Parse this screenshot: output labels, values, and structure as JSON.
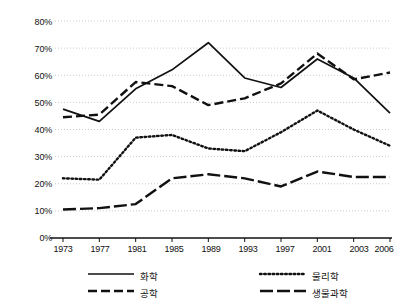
{
  "chart_data": {
    "type": "line",
    "title": "",
    "xlabel": "",
    "ylabel": "",
    "categories": [
      "1973",
      "1977",
      "1981",
      "1985",
      "1989",
      "1993",
      "1997",
      "2001",
      "2003",
      "2006"
    ],
    "ylim": [
      0,
      80
    ],
    "ytick_labels": [
      "0%",
      "10%",
      "20%",
      "30%",
      "40%",
      "50%",
      "60%",
      "70%",
      "80%"
    ],
    "ytick_values": [
      0,
      10,
      20,
      30,
      40,
      50,
      60,
      70,
      80
    ],
    "grid": "horizontal-dotted",
    "legend_position": "bottom",
    "series": [
      {
        "name": "화학",
        "style": "solid",
        "color": "#111111",
        "values": [
          47.5,
          43.0,
          55.0,
          62.0,
          72.0,
          59.0,
          55.5,
          66.0,
          59.0,
          46.0
        ]
      },
      {
        "name": "공학",
        "style": "dashed",
        "color": "#111111",
        "values": [
          44.5,
          45.5,
          57.5,
          56.0,
          49.0,
          51.5,
          57.0,
          68.0,
          58.5,
          61.0
        ]
      },
      {
        "name": "물리학",
        "style": "dotted",
        "color": "#111111",
        "values": [
          22.0,
          21.5,
          37.0,
          38.0,
          33.0,
          32.0,
          39.0,
          47.0,
          40.0,
          34.0
        ]
      },
      {
        "name": "생물과학",
        "style": "long-dash",
        "color": "#111111",
        "values": [
          10.5,
          11.0,
          12.5,
          22.0,
          23.5,
          22.0,
          19.0,
          24.5,
          22.5,
          22.5
        ]
      }
    ]
  },
  "legend": {
    "entries": [
      {
        "label": "화학",
        "style": "solid"
      },
      {
        "label": "물리학",
        "style": "dotted"
      },
      {
        "label": "공학",
        "style": "dashed"
      },
      {
        "label": "생물과학",
        "style": "long-dash"
      }
    ]
  }
}
